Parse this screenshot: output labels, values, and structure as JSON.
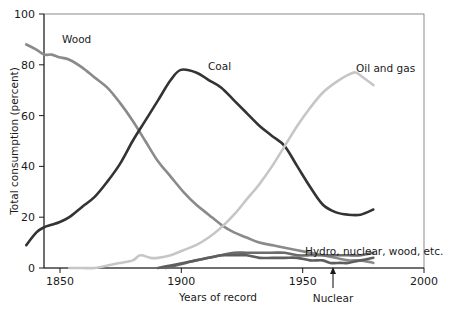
{
  "chart_data": {
    "type": "line",
    "title": "",
    "xlabel": "Years of record",
    "ylabel": "Total consumption (percent)",
    "xlim": [
      1850,
      2000
    ],
    "ylim": [
      0,
      100
    ],
    "xticks": [
      1850,
      1900,
      1950,
      2000
    ],
    "xtick_labels": [
      "1850",
      "1900",
      "1950",
      "2000"
    ],
    "yticks": [
      0,
      20,
      40,
      60,
      80,
      100
    ],
    "ytick_labels": [
      "0",
      "20",
      "40",
      "60",
      "80",
      "100"
    ],
    "grid": false,
    "legend": "inline-labels",
    "series": [
      {
        "name": "Wood",
        "color": "#8a8a8a",
        "label_text": "Wood",
        "x": [
          1843,
          1847,
          1850,
          1853,
          1856,
          1860,
          1865,
          1870,
          1875,
          1880,
          1885,
          1890,
          1895,
          1900,
          1905,
          1910,
          1915,
          1920,
          1925,
          1930,
          1935,
          1940,
          1945,
          1950,
          1955,
          1960,
          1965,
          1970,
          1975,
          1980
        ],
        "values": [
          88,
          86,
          84,
          84,
          83,
          82,
          79,
          75,
          71,
          65,
          58,
          50,
          42,
          36,
          30,
          25,
          21,
          17,
          14,
          12,
          10,
          9,
          8,
          7,
          6,
          5,
          4,
          3,
          3,
          2
        ]
      },
      {
        "name": "Coal",
        "color": "#333333",
        "label_text": "Coal",
        "x": [
          1843,
          1847,
          1850,
          1853,
          1856,
          1860,
          1865,
          1870,
          1875,
          1880,
          1885,
          1890,
          1895,
          1900,
          1904,
          1910,
          1915,
          1920,
          1925,
          1930,
          1935,
          1940,
          1945,
          1950,
          1955,
          1960,
          1965,
          1970,
          1975,
          1980
        ],
        "values": [
          9,
          14,
          16,
          17,
          18,
          20,
          24,
          28,
          34,
          41,
          50,
          58,
          66,
          74,
          78,
          77,
          74,
          71,
          66,
          61,
          56,
          52,
          48,
          40,
          32,
          25,
          22,
          21,
          21,
          23
        ]
      },
      {
        "name": "Oil and gas",
        "color": "#c6c6c6",
        "label_text": "Oil and gas",
        "x": [
          1860,
          1865,
          1870,
          1875,
          1880,
          1885,
          1888,
          1892,
          1895,
          1900,
          1905,
          1910,
          1915,
          1920,
          1925,
          1930,
          1935,
          1940,
          1945,
          1950,
          1955,
          1960,
          1965,
          1970,
          1973,
          1976,
          1980
        ],
        "values": [
          0,
          0,
          0,
          1,
          2,
          3,
          5,
          4,
          4,
          5,
          7,
          9,
          12,
          16,
          21,
          27,
          33,
          40,
          48,
          56,
          63,
          69,
          73,
          76,
          77,
          75,
          72
        ]
      },
      {
        "name": "Hydro, nuclear, wood, etc.",
        "color": "#6b6b6b",
        "label_text": "Hydro, nuclear, wood, etc.",
        "x": [
          1898,
          1902,
          1906,
          1910,
          1915,
          1920,
          1925,
          1930,
          1935,
          1940,
          1945,
          1950,
          1955,
          1960,
          1965,
          1970,
          1975,
          1980
        ],
        "values": [
          0,
          1,
          2,
          3,
          4,
          5,
          6,
          6,
          6,
          6,
          6,
          5,
          5,
          5,
          5,
          5,
          5,
          6
        ]
      },
      {
        "name": "Nuclear",
        "color": "#5e5e5e",
        "label_text": "Nuclear",
        "x": [
          1895,
          1900,
          1905,
          1910,
          1915,
          1920,
          1925,
          1930,
          1935,
          1940,
          1945,
          1950,
          1955,
          1960,
          1963,
          1967,
          1970,
          1975,
          1980
        ],
        "values": [
          0,
          1,
          2,
          3,
          4,
          5,
          5,
          5,
          4,
          4,
          4,
          4,
          3,
          3,
          2,
          2,
          2,
          3,
          4
        ]
      }
    ],
    "annotations": [
      {
        "text": "Nuclear",
        "x": 1963,
        "y": 0,
        "arrow": true
      }
    ]
  },
  "labels": {
    "wood": "Wood",
    "coal": "Coal",
    "oil_and_gas": "Oil and gas",
    "hydro_nuclear_wood": "Hydro, nuclear, wood, etc.",
    "nuclear_annotation": "Nuclear",
    "y_axis_title": "Total consumption (percent)",
    "x_axis_title": "Years of record",
    "y_ticks": {
      "t0": "0",
      "t20": "20",
      "t40": "40",
      "t60": "60",
      "t80": "80",
      "t100": "100"
    },
    "x_ticks": {
      "t1850": "1850",
      "t1900": "1900",
      "t1950": "1950",
      "t2000": "2000"
    }
  }
}
